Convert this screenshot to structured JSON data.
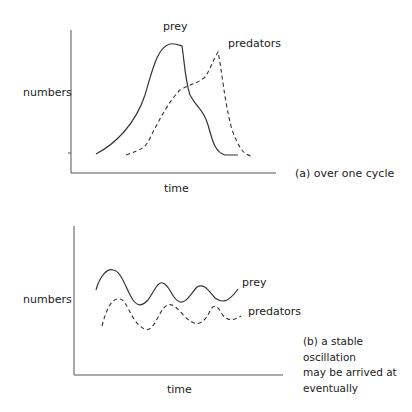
{
  "diagram": {
    "panel_a": {
      "y_label": "numbers",
      "x_label": "time",
      "series": [
        {
          "name": "prey",
          "label": "prey",
          "style": "solid"
        },
        {
          "name": "predators",
          "label": "predators",
          "style": "dashed"
        }
      ],
      "caption": "(a) over one cycle"
    },
    "panel_b": {
      "y_label": "numbers",
      "x_label": "time",
      "series": [
        {
          "name": "prey",
          "label": "prey",
          "style": "solid"
        },
        {
          "name": "predators",
          "label": "predators",
          "style": "dashed"
        }
      ],
      "caption_lines": [
        "(b) a stable oscillation",
        "may be arrived at",
        "eventually"
      ]
    },
    "colors": {
      "line": "#333333",
      "axis": "#555555",
      "text": "#222222"
    }
  }
}
